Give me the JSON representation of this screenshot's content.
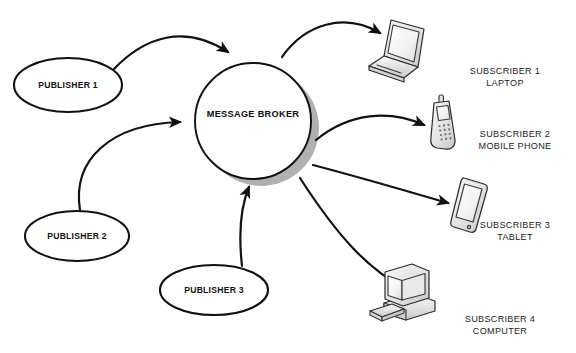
{
  "diagram": {
    "broker": {
      "label": "MESSAGE BROKER",
      "shape": "circle"
    },
    "publishers": [
      {
        "id": "publisher-1",
        "label": "PUBLISHER 1"
      },
      {
        "id": "publisher-2",
        "label": "PUBLISHER 2"
      },
      {
        "id": "publisher-3",
        "label": "PUBLISHER 3"
      }
    ],
    "subscribers": [
      {
        "id": "subscriber-1",
        "line1": "SUBSCRIBER 1",
        "line2": "LAPTOP",
        "icon": "laptop-icon"
      },
      {
        "id": "subscriber-2",
        "line1": "SUBSCRIBER 2",
        "line2": "MOBILE PHONE",
        "icon": "mobile-phone-icon"
      },
      {
        "id": "subscriber-3",
        "line1": "SUBSCRIBER 3",
        "line2": "TABLET",
        "icon": "tablet-icon"
      },
      {
        "id": "subscriber-4",
        "line1": "SUBSCRIBER 4",
        "line2": "COMPUTER",
        "icon": "desktop-computer-icon"
      }
    ],
    "colors": {
      "background": "#ffffff",
      "stroke": "#111111",
      "shadow": "#a9a9a9",
      "device_fill": "#ededed",
      "device_stroke": "#3b3b3b"
    }
  }
}
